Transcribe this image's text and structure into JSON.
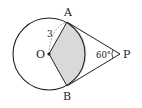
{
  "diagram": {
    "type": "geometry",
    "points": {
      "O": {
        "label": "O",
        "x": 49,
        "y": 54
      },
      "A": {
        "label": "A",
        "x": 67,
        "y": 22
      },
      "B": {
        "label": "B",
        "x": 67,
        "y": 86
      },
      "P": {
        "label": "P",
        "x": 120,
        "y": 54
      }
    },
    "circle": {
      "center": "O",
      "radius_px": 36
    },
    "annotations": {
      "radius_label": "3",
      "angle_label": "60°"
    },
    "colors": {
      "stroke": "#222222",
      "shade": "#d9d9d9",
      "dashed": "#888888"
    }
  }
}
